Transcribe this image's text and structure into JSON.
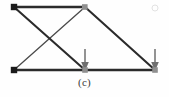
{
  "figure": {
    "caption": "(c)",
    "type": "truss-structural-diagram",
    "canvas": {
      "width": 169,
      "height": 97
    },
    "colors": {
      "background": "#fefefe",
      "member": "#2b2b2b",
      "thin_member": "#4a4a4a",
      "joint": "#1b1b1b",
      "joint_light": "#8f8f8f",
      "load_arrow": "#6f6f6f",
      "caption_text": "#3a3a3a"
    },
    "joints": [
      {
        "id": "A",
        "name": "top-left-joint",
        "x": 14,
        "y": 7,
        "style": "square-dark"
      },
      {
        "id": "B",
        "name": "top-middle-joint",
        "x": 85,
        "y": 7,
        "style": "square-light"
      },
      {
        "id": "C",
        "name": "bottom-left-joint",
        "x": 14,
        "y": 70,
        "style": "square-dark"
      },
      {
        "id": "D",
        "name": "bottom-middle-joint",
        "x": 85,
        "y": 70,
        "style": "square-light"
      },
      {
        "id": "E",
        "name": "bottom-right-joint",
        "x": 155,
        "y": 70,
        "style": "square-light"
      }
    ],
    "members": [
      {
        "name": "top-chord-AB",
        "from": "A",
        "to": "B",
        "weight": "thick"
      },
      {
        "name": "bottom-chord-CD",
        "from": "C",
        "to": "D",
        "weight": "thick"
      },
      {
        "name": "bottom-chord-DE",
        "from": "D",
        "to": "E",
        "weight": "thick"
      },
      {
        "name": "diagonal-AD",
        "from": "A",
        "to": "D",
        "weight": "medium"
      },
      {
        "name": "diagonal-BC",
        "from": "B",
        "to": "C",
        "weight": "thin"
      },
      {
        "name": "diagonal-BE",
        "from": "B",
        "to": "E",
        "weight": "medium"
      }
    ],
    "loads": [
      {
        "name": "load-arrow-at-bottom-middle",
        "x": 85,
        "tail_y": 49,
        "tip_y": 70,
        "direction": "down"
      },
      {
        "name": "load-arrow-at-bottom-right",
        "x": 155,
        "tail_y": 49,
        "tip_y": 70,
        "direction": "down"
      }
    ],
    "marks": [
      {
        "name": "faint-artifact-mark",
        "x": 155,
        "y": 8,
        "r": 3
      }
    ]
  }
}
